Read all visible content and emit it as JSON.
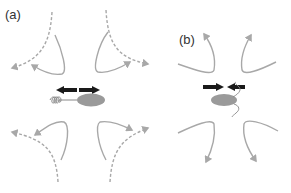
{
  "figure": {
    "panels": [
      {
        "id": "a",
        "label": "(a)",
        "swimmer_type": "pusher",
        "force_arrows": "outward",
        "flagellum": "rear helical coil"
      },
      {
        "id": "b",
        "label": "(b)",
        "swimmer_type": "puller",
        "force_arrows": "inward",
        "flagellum": "front wavy flagella"
      }
    ],
    "colors": {
      "flow_line": "#a8a8a8",
      "body": "#9a9a9a",
      "force_arrow": "#1a1a1a",
      "label": "#333333"
    }
  }
}
